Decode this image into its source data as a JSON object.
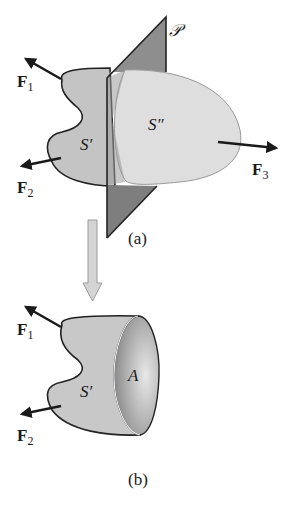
{
  "figure_a": {
    "caption": "(a)",
    "plane_label": "𝒫",
    "region_left_label": "S′",
    "region_right_label": "S″",
    "forces": [
      {
        "name": "F",
        "sub": "1"
      },
      {
        "name": "F",
        "sub": "2"
      },
      {
        "name": "F",
        "sub": "3"
      }
    ]
  },
  "figure_b": {
    "caption": "(b)",
    "region_label": "S′",
    "surface_label": "A",
    "forces": [
      {
        "name": "F",
        "sub": "1"
      },
      {
        "name": "F",
        "sub": "2"
      }
    ]
  },
  "colors": {
    "body_left": "#c4c4c4",
    "body_right": "#dedede",
    "plane": "#8a8a8a",
    "outline": "#222222",
    "transition_arrow": "#d4d4d4"
  }
}
